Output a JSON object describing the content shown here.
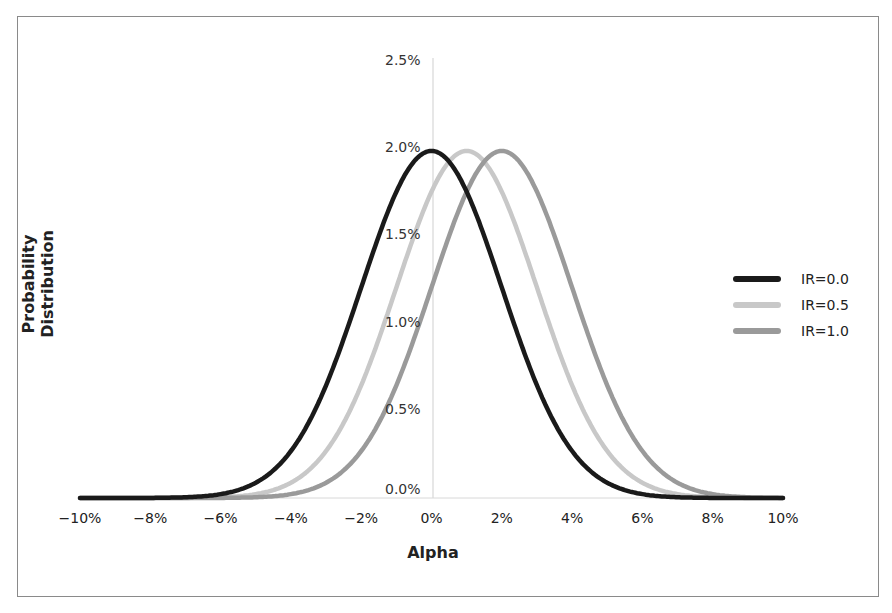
{
  "chart_data": {
    "type": "line",
    "title": "",
    "xlabel": "Alpha",
    "ylabel": "Probability Distribution",
    "x_ticks": [
      "−10%",
      "−8%",
      "−6%",
      "−4%",
      "−2%",
      "0%",
      "2%",
      "4%",
      "6%",
      "8%",
      "10%"
    ],
    "y_ticks": [
      "0.0%",
      "0.5%",
      "1.0%",
      "1.5%",
      "2.0%",
      "2.5%"
    ],
    "xlim": [
      -10,
      10
    ],
    "ylim": [
      0,
      2.5
    ],
    "grid": false,
    "legend_position": "right",
    "series": [
      {
        "name": "IR=0.0",
        "mean": 0.0,
        "std": 2.0,
        "peak": 1.99,
        "color": "#1a1a1a"
      },
      {
        "name": "IR=0.5",
        "mean": 1.0,
        "std": 2.0,
        "peak": 1.99,
        "color": "#c8c8c8"
      },
      {
        "name": "IR=1.0",
        "mean": 2.0,
        "std": 2.0,
        "peak": 1.99,
        "color": "#9a9a9a"
      }
    ]
  },
  "legend": {
    "items": [
      {
        "label": "IR=0.0"
      },
      {
        "label": "IR=0.5"
      },
      {
        "label": "IR=1.0"
      }
    ]
  },
  "axes": {
    "x_title": "Alpha",
    "y_title": "Probability Distribution"
  }
}
